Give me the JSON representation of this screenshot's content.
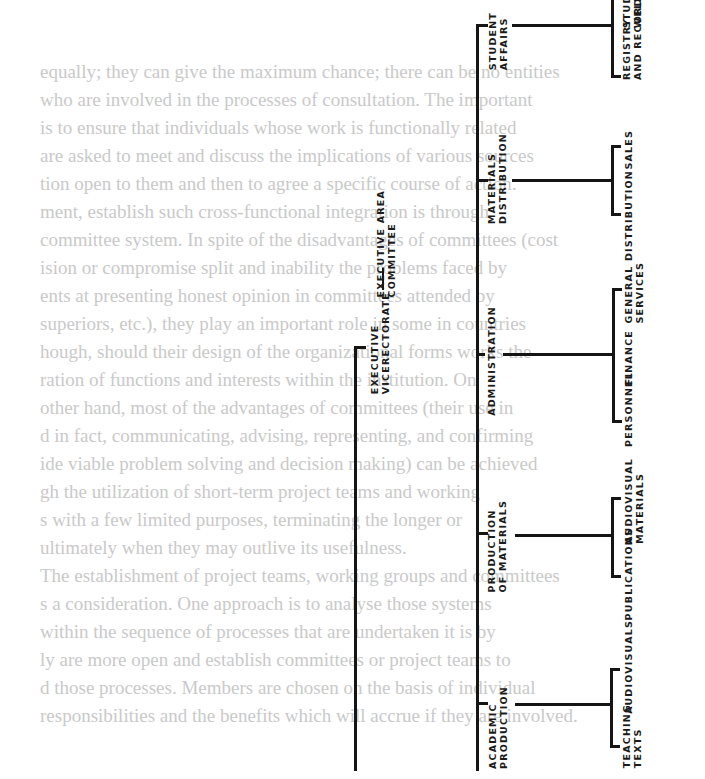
{
  "background_text": {
    "lines": [
      "equally; they can give the maximum chance; there can be no entities",
      "  who are involved in the processes of consultation. The important",
      "  is to ensure that individuals whose work is functionally related",
      "are asked to meet and discuss the implications of various sources",
      "  tion open to them and then to agree a specific course of action.",
      "  ment, establish such cross-functional integration is through",
      "  committee system. In spite of the disadvantages of committees (cost",
      "  ision or compromise split and inability the problems faced by",
      "  ents at presenting honest opinion in committees attended by",
      "  superiors, etc.), they play an important role in some in countries",
      "  hough, should their design of the organizational forms works the",
      "  ration of functions and interests within the institution. On",
      "  other hand, most of the advantages of committees (their use in",
      "  d in fact, communicating, advising, representing, and confirming",
      "  ide viable problem solving and decision making) can be achieved",
      "  gh the utilization of short-term project teams and working",
      "  s with a few limited purposes, terminating the longer or",
      "  ultimately when they may outlive its usefulness.",
      "  The establishment of project teams, working groups and committees",
      "  s a consideration. One approach is to analyse those systems",
      "  within the sequence of processes that are undertaken it is by",
      "  ly are more open and establish committees or project teams to",
      "  d those processes. Members are chosen on the basis of individual",
      "  responsibilities and the benefits which will accrue if they are involved."
    ]
  },
  "org_chart": {
    "root": "EXECUTIVE\nVICERECTORATE",
    "adjunct": "EXECUTIVE AREA\nCOMMITTEE",
    "divisions": [
      {
        "name": "STUDENT\nAFFAIRS",
        "units": [
          "REGISTRY\nAND RECORDS",
          "STUDENT\nWELFARE"
        ]
      },
      {
        "name": "MATERIALS\nDISTRIBUTION",
        "units": [
          "DISTRIBUTION",
          "SALES"
        ]
      },
      {
        "name": "ADMINISTRATION",
        "units": [
          "PERSONNEL",
          "FINANCE",
          "GENERAL\nSERVICES"
        ]
      },
      {
        "name": "PRODUCTION\nOF MATERIALS",
        "units": [
          "PUBLICATIONS",
          "AUDIOVISUAL\nMATERIALS"
        ]
      },
      {
        "name": "ACADEMIC\nPRODUCTION",
        "units": [
          "TEACHING\nTEXTS",
          "AUDIOVISUALS"
        ]
      }
    ]
  },
  "colors": {
    "ink": "#151515",
    "bleed_text": "#c9c9c9",
    "paper": "#ffffff"
  }
}
